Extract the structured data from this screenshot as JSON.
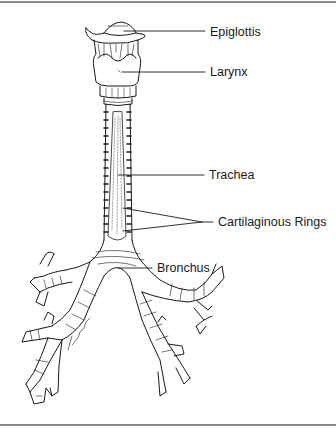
{
  "diagram": {
    "type": "anatomical-illustration",
    "labels": [
      {
        "id": "epiglottis",
        "text": "Epiglottis",
        "x": 210,
        "y": 25
      },
      {
        "id": "larynx",
        "text": "Larynx",
        "x": 210,
        "y": 65
      },
      {
        "id": "trachea",
        "text": "Trachea",
        "x": 209,
        "y": 168
      },
      {
        "id": "cartilaginous-rings",
        "text": "Cartilaginous Rings",
        "x": 218,
        "y": 215
      },
      {
        "id": "bronchus",
        "text": "Bronchus",
        "x": 157,
        "y": 261
      }
    ],
    "signature": "L. Michael",
    "colors": {
      "ink": "#1a1a1a",
      "rule": "#8a8a8a",
      "background": "#ffffff"
    }
  }
}
